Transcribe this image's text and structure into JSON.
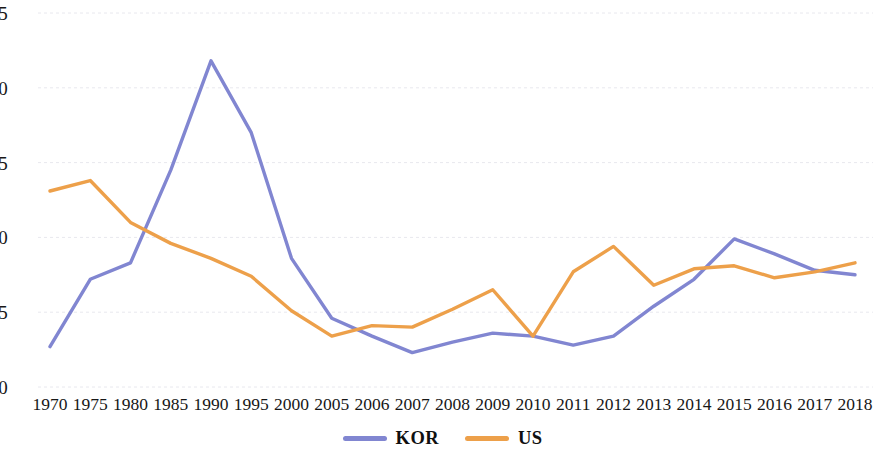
{
  "chart_data": {
    "type": "line",
    "title": "",
    "subtitle": "",
    "xlabel": "",
    "ylabel": "",
    "categories": [
      "1970",
      "1975",
      "1980",
      "1985",
      "1990",
      "1995",
      "2000",
      "2005",
      "2006",
      "2007",
      "2008",
      "2009",
      "2010",
      "2011",
      "2012",
      "2013",
      "2014",
      "2015",
      "2016",
      "2017",
      "2018"
    ],
    "series": [
      {
        "name": "KOR",
        "color": "#8186D1",
        "values": [
          2.7,
          7.2,
          8.3,
          14.5,
          21.8,
          17.0,
          8.6,
          4.6,
          3.4,
          2.3,
          3.0,
          3.6,
          3.4,
          2.8,
          3.4,
          5.4,
          7.2,
          9.9,
          8.9,
          7.8,
          7.5
        ]
      },
      {
        "name": "US",
        "color": "#EDA04A",
        "values": [
          13.1,
          13.8,
          11.0,
          9.6,
          8.6,
          7.4,
          5.1,
          3.4,
          4.1,
          4.0,
          5.2,
          6.5,
          3.4,
          7.7,
          9.4,
          6.8,
          7.9,
          8.1,
          7.3,
          7.7,
          8.3
        ]
      }
    ],
    "ylim": [
      0,
      25
    ],
    "yticks": [
      0,
      5,
      10,
      15,
      20,
      25
    ],
    "ytick_labels": [
      "0",
      "5",
      "10",
      "15",
      "20",
      "25"
    ],
    "grid": true,
    "grid_color": "#E8E8EE",
    "legend_position": "bottom",
    "background": "#FFFFFF"
  },
  "legend": {
    "items": [
      {
        "label": "KOR",
        "color": "#8186D1"
      },
      {
        "label": "US",
        "color": "#EDA04A"
      }
    ]
  }
}
